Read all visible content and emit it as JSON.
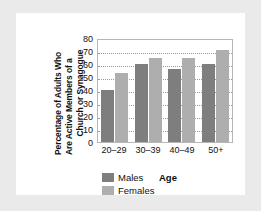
{
  "chart_data": {
    "type": "bar",
    "title": "",
    "xlabel": "Age",
    "ylabel": "Percentage of Adults Who Are Active Members of a Church or Synagogue",
    "ylabel_lines": [
      "Percentage of Adults Who",
      "Are Active Members of a",
      "Church or Synagogue"
    ],
    "categories": [
      "20–29",
      "30–39",
      "40–49",
      "50+"
    ],
    "series": [
      {
        "name": "Males",
        "color": "#7e7e7e",
        "values": [
          40,
          60,
          56,
          60
        ]
      },
      {
        "name": "Females",
        "color": "#aeaeae",
        "values": [
          53,
          65,
          65,
          71
        ]
      }
    ],
    "ylim": [
      0,
      80
    ],
    "yticks": [
      80,
      70,
      60,
      50,
      40,
      30,
      20,
      10,
      0
    ],
    "grid": true,
    "legend_position": "below-axis-left"
  },
  "legend": {
    "items": [
      {
        "label": "Males",
        "color": "#7e7e7e"
      },
      {
        "label": "Females",
        "color": "#aeaeae"
      }
    ]
  },
  "figure": {
    "background": "#eaeaea",
    "panel_background": "#ffffff",
    "plot_border": "#b6b6b6"
  }
}
